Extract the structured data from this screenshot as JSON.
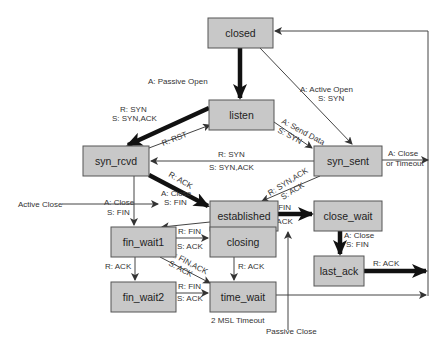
{
  "diagram": {
    "states": {
      "closed": "closed",
      "listen": "listen",
      "syn_rcvd": "syn_rcvd",
      "syn_sent": "syn_sent",
      "established": "established",
      "close_wait": "close_wait",
      "fin_wait1": "fin_wait1",
      "closing": "closing",
      "last_ack": "last_ack",
      "fin_wait2": "fin_wait2",
      "time_wait": "time_wait"
    },
    "labels": {
      "passive_open": "A: Passive Open",
      "active_open_1": "A: Active Open",
      "active_open_2": "S: SYN",
      "listen_synrcvd_1": "R: SYN",
      "listen_synrcvd_2": "S: SYN,ACK",
      "rst": "R: RST",
      "send_data_1": "A: Send Data",
      "send_data_2": "S: SYN",
      "synsent_synrcvd_1": "R: SYN",
      "synsent_synrcvd_2": "S: SYN,ACK",
      "close_timeout_1": "A: Close",
      "close_timeout_2": "or Timeout",
      "synrcvd_ack": "R: ACK",
      "synack_1": "R: SYN,ACK",
      "synack_2": "S: ACK",
      "synrcvd_close_1": "A: Close",
      "synrcvd_close_2": "S: FIN",
      "active_close": "Active Close",
      "est_close_1": "A: Close",
      "est_close_2": "S: FIN",
      "est_fin_1": "R: FIN",
      "est_fin_2": "S: ACK",
      "cw_close_1": "A: Close",
      "cw_close_2": "S: FIN",
      "lastack_ack": "R: ACK",
      "fw1_fin_1": "R: FIN",
      "fw1_fin_2": "S: ACK",
      "fw1_finack_1": "R: FIN,ACK",
      "fw1_finack_2": "S: ACK",
      "fw1_ack": "R: ACK",
      "closing_ack": "R: ACK",
      "fw2_fin_1": "R: FIN",
      "fw2_fin_2": "S: ACK",
      "msl_timeout": "2 MSL Timeout",
      "passive_close": "Passive Close"
    }
  }
}
